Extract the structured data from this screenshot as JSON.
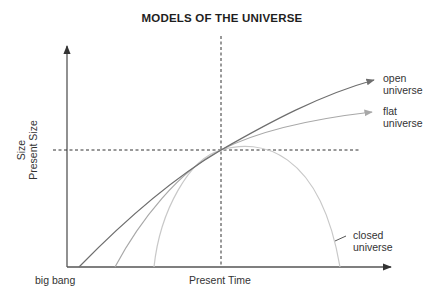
{
  "title": "MODELS OF THE UNIVERSE",
  "axes": {
    "y_label_line1": "Size",
    "y_label_line2": "Present Size",
    "x_label_present": "Present Time",
    "x_label_origin": "big bang"
  },
  "curves": [
    {
      "name": "open",
      "label_line1": "open",
      "label_line2": "universe",
      "color": "#6e6e6e"
    },
    {
      "name": "flat",
      "label_line1": "flat",
      "label_line2": "universe",
      "color": "#a8a8a8"
    },
    {
      "name": "closed",
      "label_line1": "closed",
      "label_line2": "universe",
      "color": "#c8c8c8"
    }
  ],
  "colors": {
    "axis": "#555555",
    "dashed": "#333333"
  }
}
